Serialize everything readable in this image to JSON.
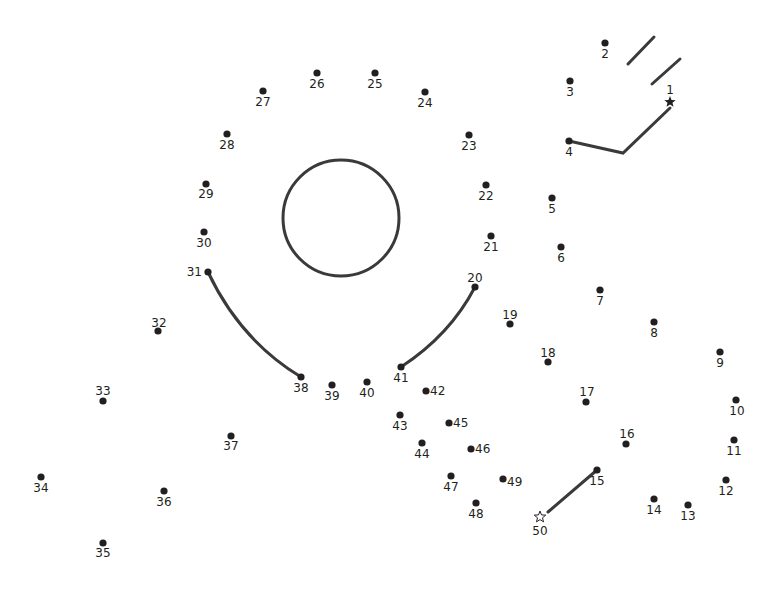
{
  "puzzle": {
    "type": "connect-the-dots",
    "dot_color": "#231f20",
    "line_color": "#3a3a3a",
    "start_marker": "filled-star",
    "end_marker": "hollow-star",
    "points": [
      {
        "n": "1",
        "x": 670,
        "y": 102,
        "lx": 670,
        "ly": 94,
        "anchor": "middle",
        "marker": "star-filled"
      },
      {
        "n": "2",
        "x": 605,
        "y": 43,
        "lx": 605,
        "ly": 58,
        "anchor": "middle"
      },
      {
        "n": "3",
        "x": 570,
        "y": 81,
        "lx": 570,
        "ly": 96,
        "anchor": "middle"
      },
      {
        "n": "4",
        "x": 569,
        "y": 141,
        "lx": 569,
        "ly": 156,
        "anchor": "middle"
      },
      {
        "n": "5",
        "x": 552,
        "y": 198,
        "lx": 552,
        "ly": 213,
        "anchor": "middle"
      },
      {
        "n": "6",
        "x": 561,
        "y": 247,
        "lx": 561,
        "ly": 262,
        "anchor": "middle"
      },
      {
        "n": "7",
        "x": 600,
        "y": 290,
        "lx": 600,
        "ly": 305,
        "anchor": "middle"
      },
      {
        "n": "8",
        "x": 654,
        "y": 322,
        "lx": 654,
        "ly": 337,
        "anchor": "middle"
      },
      {
        "n": "9",
        "x": 720,
        "y": 352,
        "lx": 720,
        "ly": 367,
        "anchor": "middle"
      },
      {
        "n": "10",
        "x": 736,
        "y": 400,
        "lx": 737,
        "ly": 415,
        "anchor": "middle"
      },
      {
        "n": "11",
        "x": 734,
        "y": 440,
        "lx": 734,
        "ly": 455,
        "anchor": "middle"
      },
      {
        "n": "12",
        "x": 726,
        "y": 480,
        "lx": 726,
        "ly": 495,
        "anchor": "middle"
      },
      {
        "n": "13",
        "x": 688,
        "y": 505,
        "lx": 688,
        "ly": 520,
        "anchor": "middle"
      },
      {
        "n": "14",
        "x": 654,
        "y": 499,
        "lx": 654,
        "ly": 514,
        "anchor": "middle"
      },
      {
        "n": "15",
        "x": 597,
        "y": 470,
        "lx": 597,
        "ly": 485,
        "anchor": "middle"
      },
      {
        "n": "16",
        "x": 626,
        "y": 444,
        "lx": 627,
        "ly": 438,
        "anchor": "middle"
      },
      {
        "n": "17",
        "x": 586,
        "y": 402,
        "lx": 587,
        "ly": 396,
        "anchor": "middle"
      },
      {
        "n": "18",
        "x": 548,
        "y": 362,
        "lx": 548,
        "ly": 357,
        "anchor": "middle"
      },
      {
        "n": "19",
        "x": 510,
        "y": 324,
        "lx": 510,
        "ly": 319,
        "anchor": "middle"
      },
      {
        "n": "20",
        "x": 475,
        "y": 287,
        "lx": 475,
        "ly": 282,
        "anchor": "middle"
      },
      {
        "n": "21",
        "x": 491,
        "y": 236,
        "lx": 491,
        "ly": 251,
        "anchor": "middle"
      },
      {
        "n": "22",
        "x": 486,
        "y": 185,
        "lx": 486,
        "ly": 200,
        "anchor": "middle"
      },
      {
        "n": "23",
        "x": 469,
        "y": 135,
        "lx": 469,
        "ly": 150,
        "anchor": "middle"
      },
      {
        "n": "24",
        "x": 425,
        "y": 92,
        "lx": 425,
        "ly": 107,
        "anchor": "middle"
      },
      {
        "n": "25",
        "x": 375,
        "y": 73,
        "lx": 375,
        "ly": 88,
        "anchor": "middle"
      },
      {
        "n": "26",
        "x": 317,
        "y": 73,
        "lx": 317,
        "ly": 88,
        "anchor": "middle"
      },
      {
        "n": "27",
        "x": 263,
        "y": 91,
        "lx": 263,
        "ly": 106,
        "anchor": "middle"
      },
      {
        "n": "28",
        "x": 227,
        "y": 134,
        "lx": 227,
        "ly": 149,
        "anchor": "middle"
      },
      {
        "n": "29",
        "x": 206,
        "y": 184,
        "lx": 206,
        "ly": 198,
        "anchor": "middle"
      },
      {
        "n": "30",
        "x": 204,
        "y": 232,
        "lx": 204,
        "ly": 247,
        "anchor": "middle"
      },
      {
        "n": "31",
        "x": 208,
        "y": 272,
        "lx": 202,
        "ly": 276,
        "anchor": "end"
      },
      {
        "n": "32",
        "x": 158,
        "y": 331,
        "lx": 159,
        "ly": 327,
        "anchor": "middle"
      },
      {
        "n": "33",
        "x": 103,
        "y": 401,
        "lx": 103,
        "ly": 395,
        "anchor": "middle"
      },
      {
        "n": "34",
        "x": 41,
        "y": 477,
        "lx": 41,
        "ly": 492,
        "anchor": "middle"
      },
      {
        "n": "35",
        "x": 103,
        "y": 543,
        "lx": 103,
        "ly": 557,
        "anchor": "middle"
      },
      {
        "n": "36",
        "x": 164,
        "y": 491,
        "lx": 164,
        "ly": 506,
        "anchor": "middle"
      },
      {
        "n": "37",
        "x": 231,
        "y": 436,
        "lx": 231,
        "ly": 450,
        "anchor": "middle"
      },
      {
        "n": "38",
        "x": 301,
        "y": 377,
        "lx": 301,
        "ly": 392,
        "anchor": "middle"
      },
      {
        "n": "39",
        "x": 332,
        "y": 385,
        "lx": 332,
        "ly": 400,
        "anchor": "middle"
      },
      {
        "n": "40",
        "x": 367,
        "y": 382,
        "lx": 367,
        "ly": 397,
        "anchor": "middle"
      },
      {
        "n": "41",
        "x": 401,
        "y": 367,
        "lx": 401,
        "ly": 382,
        "anchor": "middle"
      },
      {
        "n": "42",
        "x": 426,
        "y": 391,
        "lx": 430,
        "ly": 395,
        "anchor": "start"
      },
      {
        "n": "43",
        "x": 400,
        "y": 415,
        "lx": 400,
        "ly": 430,
        "anchor": "middle"
      },
      {
        "n": "44",
        "x": 422,
        "y": 443,
        "lx": 422,
        "ly": 458,
        "anchor": "middle"
      },
      {
        "n": "45",
        "x": 449,
        "y": 423,
        "lx": 453,
        "ly": 427,
        "anchor": "start"
      },
      {
        "n": "46",
        "x": 471,
        "y": 449,
        "lx": 475,
        "ly": 453,
        "anchor": "start"
      },
      {
        "n": "47",
        "x": 451,
        "y": 476,
        "lx": 451,
        "ly": 491,
        "anchor": "middle"
      },
      {
        "n": "48",
        "x": 476,
        "y": 503,
        "lx": 476,
        "ly": 518,
        "anchor": "middle"
      },
      {
        "n": "49",
        "x": 503,
        "y": 479,
        "lx": 507,
        "ly": 486,
        "anchor": "start"
      },
      {
        "n": "50",
        "x": 540,
        "y": 517,
        "lx": 540,
        "ly": 535,
        "anchor": "middle",
        "marker": "star-hollow"
      }
    ],
    "drawn_segments": [
      {
        "from": "1",
        "path": "M670,108 L623,153 L569,141"
      },
      {
        "from": "31",
        "to": "38",
        "path": "M208,272 Q240,340 301,377"
      },
      {
        "from": "20",
        "to": "41",
        "path": "M475,287 Q450,335 401,367"
      },
      {
        "from": "15",
        "to": "50",
        "path": "M597,470 L548,512"
      },
      {
        "name": "motion-line-1",
        "path": "M628,64 L654,37"
      },
      {
        "name": "motion-line-2",
        "path": "M652,84 L680,59"
      }
    ],
    "circle": {
      "cx": 341,
      "cy": 218,
      "r": 58
    }
  }
}
